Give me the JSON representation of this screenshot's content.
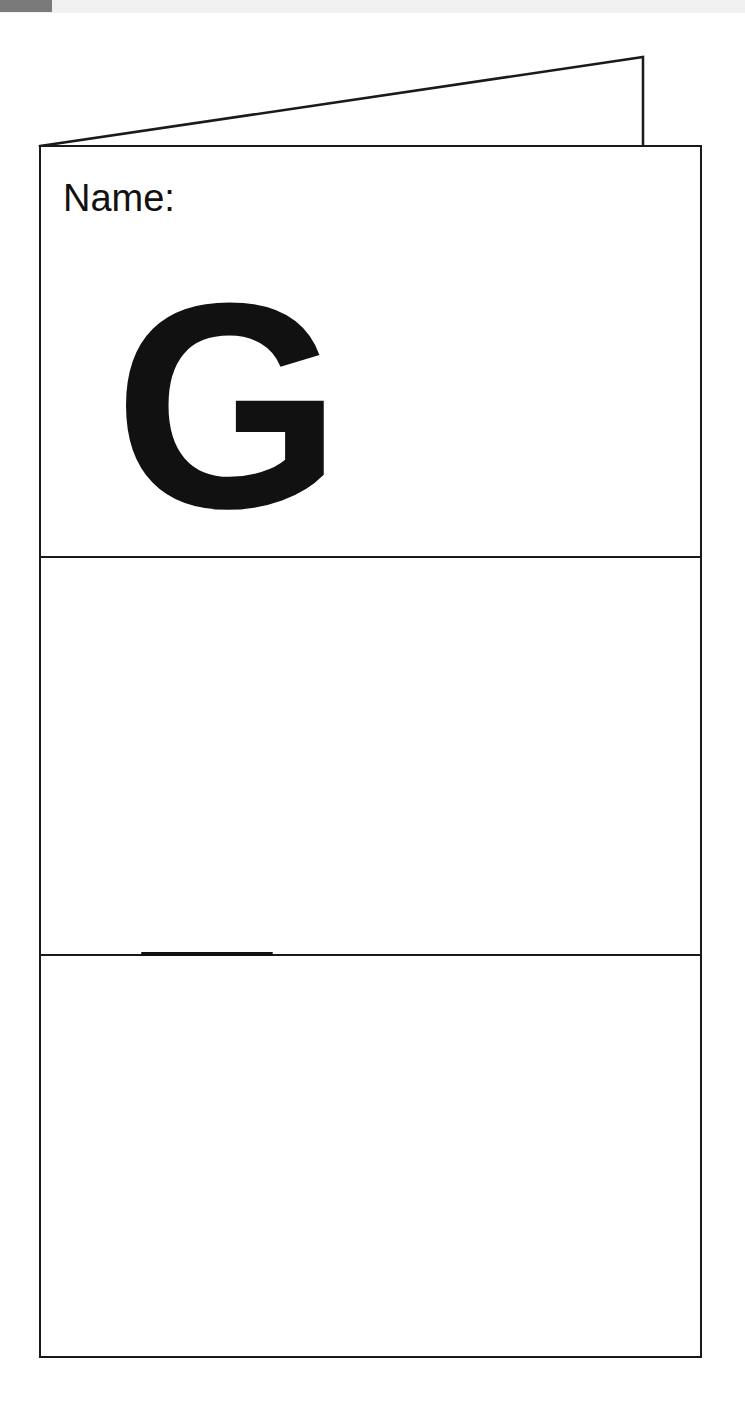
{
  "document": {
    "type": "worksheet-foldable-card",
    "title_field": {
      "label": "Name:",
      "value": ""
    },
    "scan_artifact": {
      "strip_color": "#f0f0f0",
      "block_color": "#7a7a7a"
    },
    "ink_color": "#111111",
    "page_background": "#ffffff",
    "flap": {
      "description": "folded-triangle-flap"
    },
    "panels": [
      {
        "letter": "G",
        "panel_name": "panel-letter-g"
      },
      {
        "letter": "E",
        "panel_name": "panel-letter-e"
      },
      {
        "letter": "L",
        "panel_name": "panel-letter-l"
      }
    ],
    "word": "GEL"
  }
}
